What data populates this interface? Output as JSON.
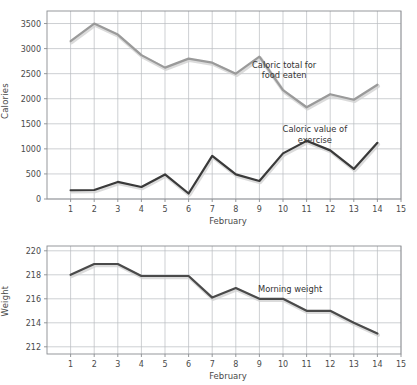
{
  "figure": {
    "background_color": "#ffffff",
    "grid_color": "#b9bcc0",
    "axis_color": "#8a8d91",
    "text_color": "#4a4a4a"
  },
  "charts": [
    {
      "id": "calories",
      "ylabel": "Calories",
      "xlabel": "February"
    },
    {
      "id": "weight",
      "ylabel": "Weight",
      "xlabel": "February"
    }
  ],
  "chart_data": [
    {
      "type": "line",
      "title": "",
      "xlabel": "February",
      "ylabel": "Calories",
      "x": [
        1,
        2,
        3,
        4,
        5,
        6,
        7,
        8,
        9,
        10,
        11,
        12,
        13,
        14
      ],
      "xticklabels": [
        "1",
        "2",
        "3",
        "4",
        "5",
        "6",
        "7",
        "8",
        "9",
        "10",
        "11",
        "12",
        "13",
        "14",
        "15"
      ],
      "xticks": [
        1,
        2,
        3,
        4,
        5,
        6,
        7,
        8,
        9,
        10,
        11,
        12,
        13,
        14,
        15
      ],
      "xlim": [
        0,
        15
      ],
      "ylim": [
        0,
        3750
      ],
      "yticks": [
        0,
        500,
        1000,
        1500,
        2000,
        2500,
        3000,
        3500
      ],
      "yticklabels": [
        "0",
        "500",
        "1000",
        "1500",
        "2000",
        "2500",
        "3000",
        "3500"
      ],
      "grid": true,
      "legend": "annotations",
      "series": [
        {
          "name": "Caloric total for food eaten",
          "color": "#9a9a9a",
          "values": [
            3150,
            3500,
            3280,
            2870,
            2620,
            2800,
            2720,
            2500,
            2840,
            2170,
            1830,
            2090,
            1980,
            2280
          ],
          "annotation": {
            "lines": [
              "Caloric total for",
              "food eaten"
            ],
            "x": 10.05,
            "y": 2620
          }
        },
        {
          "name": "Caloric value of exercise",
          "color": "#3a3a3a",
          "values": [
            175,
            180,
            340,
            240,
            490,
            110,
            860,
            490,
            360,
            910,
            1160,
            970,
            600,
            1120
          ],
          "annotation": {
            "lines": [
              "Caloric value of",
              "exercise"
            ],
            "x": 11.35,
            "y": 1330
          }
        }
      ]
    },
    {
      "type": "line",
      "title": "",
      "xlabel": "February",
      "ylabel": "Weight",
      "x": [
        1,
        2,
        3,
        4,
        5,
        6,
        7,
        8,
        9,
        10,
        11,
        12,
        13,
        14
      ],
      "xticklabels": [
        "1",
        "2",
        "3",
        "4",
        "5",
        "6",
        "7",
        "8",
        "9",
        "10",
        "11",
        "12",
        "13",
        "14",
        "15"
      ],
      "xticks": [
        1,
        2,
        3,
        4,
        5,
        6,
        7,
        8,
        9,
        10,
        11,
        12,
        13,
        14,
        15
      ],
      "xlim": [
        0,
        15
      ],
      "ylim": [
        211.4,
        220.4
      ],
      "yticks": [
        212,
        214,
        216,
        218,
        220
      ],
      "yticklabels": [
        "212",
        "214",
        "216",
        "218",
        "220"
      ],
      "grid": true,
      "legend": "annotations",
      "series": [
        {
          "name": "Morning weight",
          "color": "#4a4a4a",
          "values": [
            218.0,
            218.9,
            218.9,
            217.9,
            217.9,
            217.9,
            216.1,
            216.9,
            216.0,
            216.0,
            215.0,
            215.0,
            214.0,
            213.1
          ],
          "annotation": {
            "lines": [
              "Morning weight"
            ],
            "x": 10.3,
            "y": 216.55
          }
        }
      ]
    }
  ]
}
